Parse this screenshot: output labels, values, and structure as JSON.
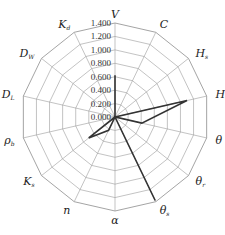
{
  "chart_data": {
    "type": "radar",
    "title": "",
    "axes": [
      {
        "label": "V",
        "sub": ""
      },
      {
        "label": "C",
        "sub": ""
      },
      {
        "label": "H",
        "sub": "s"
      },
      {
        "label": "H",
        "sub": "t"
      },
      {
        "label": "θ",
        "sub": ""
      },
      {
        "label": "θ",
        "sub": "r"
      },
      {
        "label": "θ",
        "sub": "s"
      },
      {
        "label": "α",
        "sub": ""
      },
      {
        "label": "n",
        "sub": ""
      },
      {
        "label": "K",
        "sub": "s"
      },
      {
        "label": "ρ",
        "sub": "b"
      },
      {
        "label": "D",
        "sub": "L"
      },
      {
        "label": "D",
        "sub": "W"
      },
      {
        "label": "K",
        "sub": "d"
      }
    ],
    "categories": [
      "V",
      "C",
      "H_s",
      "H_t",
      "θ",
      "θ_r",
      "θ_s",
      "α",
      "n",
      "K_s",
      "ρ_b",
      "D_L",
      "D_W",
      "K_d"
    ],
    "series": [
      {
        "name": "sensitivity",
        "values": [
          0.62,
          0.0,
          0.0,
          1.1,
          0.41,
          0.0,
          1.38,
          0.0,
          0.22,
          0.5,
          0.0,
          0.0,
          0.0,
          0.0
        ]
      }
    ],
    "tick_labels": [
      "0.000",
      "0.200",
      "0.400",
      "0.600",
      "0.800",
      "1.000",
      "1.200",
      "1.400"
    ],
    "rlim": [
      0,
      1.4
    ],
    "grid": true,
    "legend": "none"
  },
  "style": {
    "grid_color": "#9a9a9a",
    "line_color": "#333333"
  }
}
